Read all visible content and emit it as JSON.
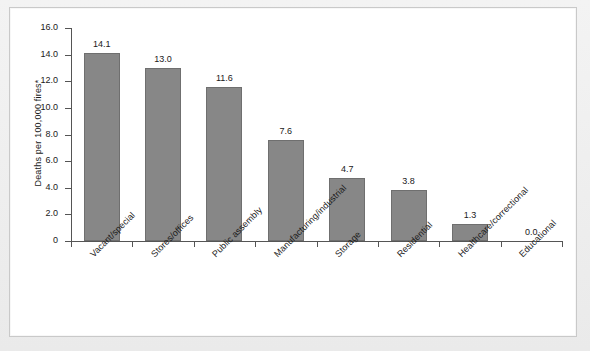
{
  "chart_data": {
    "type": "bar",
    "title": "",
    "xlabel": "",
    "ylabel": "Deaths per 100,000 fires*",
    "ylim": [
      0,
      16
    ],
    "ytick_labels": [
      "16.0",
      "14.0",
      "12.0",
      "10.0",
      "8.0",
      "6.0",
      "4.0",
      "2.0",
      "0"
    ],
    "ytick_values": [
      16.0,
      14.0,
      12.0,
      10.0,
      8.0,
      6.0,
      4.0,
      2.0,
      0
    ],
    "grid": false,
    "legend": false,
    "bar_color": "#878787",
    "bar_edge_color": "#6f6f6f",
    "categories": [
      "Vacant/special",
      "Stores/offices",
      "Public assembly",
      "Manufacturing/industrial",
      "Storage",
      "Residential",
      "Healthcare/correctional",
      "Educational"
    ],
    "values": [
      14.1,
      13.0,
      11.6,
      7.6,
      4.7,
      3.8,
      1.3,
      0.0
    ],
    "value_labels": [
      "14.1",
      "13.0",
      "11.6",
      "7.6",
      "4.7",
      "3.8",
      "1.3",
      "0.0"
    ]
  }
}
